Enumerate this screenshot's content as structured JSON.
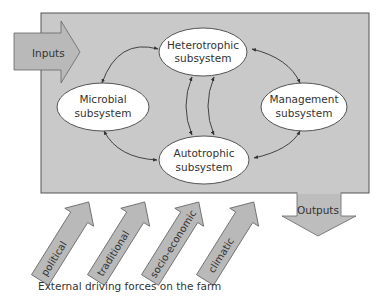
{
  "diagram": {
    "inputs_label": "Inputs",
    "outputs_label": "Outputs",
    "subsystems": {
      "heterotrophic": {
        "line1": "Heterotrophic",
        "line2": "subsystem"
      },
      "microbial": {
        "line1": "Microbial",
        "line2": "subsystem"
      },
      "management": {
        "line1": "Management",
        "line2": "subsystem"
      },
      "autotrophic": {
        "line1": "Autotrophic",
        "line2": "subsystem"
      }
    },
    "driving_forces": [
      {
        "label": "political"
      },
      {
        "label": "traditional"
      },
      {
        "label": "socio-economic"
      },
      {
        "label": "climatic"
      }
    ],
    "caption": "External driving forces on the farm",
    "colors": {
      "box_fill": "#c8c8c8",
      "arrow_fill": "#b9b9b9",
      "ellipse_fill": "#ffffff",
      "stroke": "#444444"
    }
  }
}
